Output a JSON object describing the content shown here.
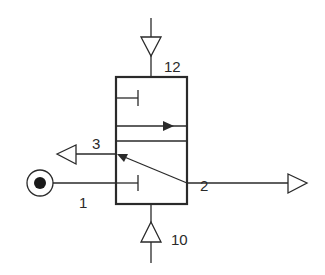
{
  "diagram": {
    "type": "pneumatic 3/2-way valve symbol (double pilot operated)",
    "colors": {
      "line": "#2a2a2a",
      "background": "#ffffff"
    },
    "ports": {
      "pilot_top": {
        "label": "12",
        "symbol": "pilot-triangle-down"
      },
      "pilot_bottom": {
        "label": "10",
        "symbol": "pilot-triangle-up"
      },
      "exhaust": {
        "label": "3",
        "symbol": "exhaust-triangle-left"
      },
      "outlet": {
        "label": "2",
        "symbol": "outlet-triangle-right"
      },
      "supply": {
        "label": "1",
        "symbol": "pressure-source-circle"
      }
    },
    "positions": [
      {
        "name": "upper",
        "content": "blocked port (T-stop), flow arrow left-to-right"
      },
      {
        "name": "lower",
        "content": "flow 2 to 3 (diagonal arrow), port 1 blocked (T-stop)"
      }
    ]
  }
}
